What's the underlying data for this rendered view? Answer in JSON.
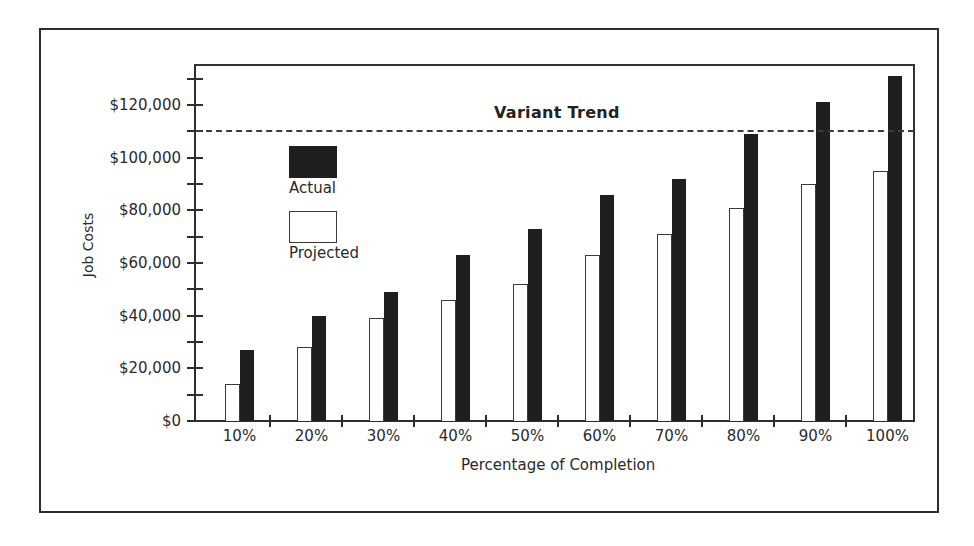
{
  "chart_data": {
    "type": "bar",
    "title": "",
    "xlabel": "Percentage of Completion",
    "ylabel": "Job Costs",
    "categories": [
      "10%",
      "20%",
      "30%",
      "40%",
      "50%",
      "60%",
      "70%",
      "80%",
      "90%",
      "100%"
    ],
    "series": [
      {
        "name": "Projected",
        "color": "#ffffff",
        "values": [
          14000,
          28000,
          39000,
          46000,
          52000,
          63000,
          71000,
          81000,
          90000,
          95000
        ]
      },
      {
        "name": "Actual",
        "color": "#1f1f1f",
        "values": [
          27000,
          40000,
          49000,
          63000,
          73000,
          86000,
          92000,
          109000,
          121000,
          131000
        ]
      }
    ],
    "yticks": [
      0,
      20000,
      40000,
      60000,
      80000,
      100000,
      120000
    ],
    "ytick_labels": [
      "$0",
      "$20,000",
      "$40,000",
      "$60,000",
      "$80,000",
      "$100,000",
      "$120,000"
    ],
    "ylim": [
      0,
      135000
    ],
    "grid": false,
    "legend": {
      "position": "upper-left-inside",
      "entries": [
        "Actual",
        "Projected"
      ]
    },
    "annotations": [
      {
        "type": "hline",
        "style": "dashed",
        "y": 110000,
        "label": "Variant Trend"
      }
    ]
  },
  "legend": {
    "actual_label": "Actual",
    "projected_label": "Projected"
  },
  "axes": {
    "y_title": "Job Costs",
    "x_title": "Percentage of Completion"
  },
  "annotation": {
    "trend_label": "Variant Trend"
  }
}
